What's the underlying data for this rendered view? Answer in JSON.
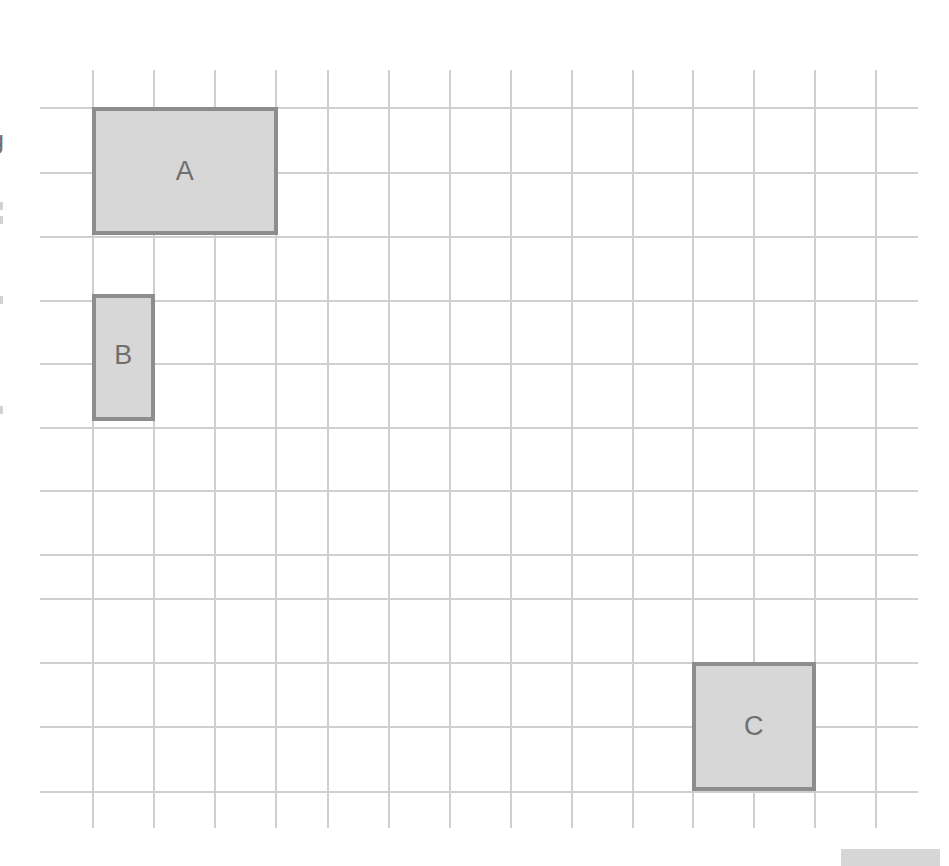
{
  "page": {
    "background_color": "#ffffff",
    "width": 949,
    "height": 866
  },
  "grid": {
    "line_color": "#cfcfcf",
    "cell_size_px": 61,
    "origin_x": 92,
    "origin_y": 107,
    "vertical_lines_x": [
      92,
      153,
      214,
      275,
      327,
      388,
      449,
      510,
      571,
      632,
      692,
      753,
      814,
      875
    ],
    "vertical_line_top": 70,
    "vertical_line_bottom": 828,
    "horizontal_lines_y": [
      107,
      172,
      236,
      300,
      363,
      427,
      490,
      554,
      598,
      662,
      726,
      791
    ],
    "horizontal_line_left": 40,
    "horizontal_line_right": 918
  },
  "shapes": [
    {
      "label": "A",
      "name": "rectangle-a",
      "x": 92,
      "y": 107,
      "width": 186,
      "height": 128,
      "cells_wide": 3,
      "cells_tall": 2,
      "fill_color": "#d7d7d7",
      "border_color": "#8d8d8d"
    },
    {
      "label": "B",
      "name": "rectangle-b",
      "x": 92,
      "y": 294,
      "width": 63,
      "height": 127,
      "cells_wide": 1,
      "cells_tall": 2,
      "fill_color": "#d7d7d7",
      "border_color": "#8d8d8d"
    },
    {
      "label": "C",
      "name": "rectangle-c",
      "x": 692,
      "y": 662,
      "width": 124,
      "height": 129,
      "cells_wide": 2,
      "cells_tall": 2,
      "fill_color": "#d7d7d7",
      "border_color": "#8d8d8d"
    }
  ],
  "margin": {
    "clipped_glyph": "g",
    "clipped_glyph_y": 128
  },
  "corner_bar": {
    "name": "corner-bar",
    "x": 841,
    "y": 849,
    "width": 99,
    "height": 17,
    "color": "#d6d6d6"
  }
}
